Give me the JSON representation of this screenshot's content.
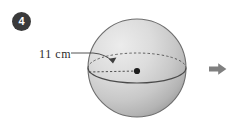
{
  "figure": {
    "number_badge": "4",
    "dimension_label": "11 cm",
    "shape": "sphere",
    "shape_name": "sphere-illustration",
    "next_arrow": "next-arrow-icon",
    "colors": {
      "badge_fill": "#3a3a3a",
      "badge_text": "#ffffff",
      "sphere_light": "#e4e4e4",
      "sphere_mid": "#c9c9c9",
      "sphere_dark": "#a9a9a9",
      "outline": "#555555",
      "label_text": "#2b2b2b",
      "arrow_fill": "#808080",
      "background": "#ffffff"
    },
    "annotations": {
      "radius_line": "radius from center to surface",
      "equator": "equator great circle",
      "center_point": "sphere center"
    }
  }
}
